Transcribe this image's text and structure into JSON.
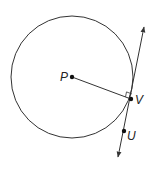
{
  "diagram": {
    "type": "geometry",
    "colors": {
      "stroke": "#333333",
      "background": "#ffffff"
    },
    "circle": {
      "center_label": "P",
      "cx": 72,
      "cy": 77,
      "r": 61
    },
    "points": [
      {
        "label": "P",
        "x": 72,
        "y": 77
      },
      {
        "label": "V",
        "x": 131,
        "y": 99
      },
      {
        "label": "U",
        "x": 124,
        "y": 131
      }
    ],
    "segments": [
      {
        "from": "P",
        "to": "V"
      }
    ],
    "tangent_line": {
      "through": [
        "V",
        "U"
      ],
      "arrows": "both"
    },
    "right_angle_marker": {
      "at": "V",
      "between": [
        "PV",
        "tangent"
      ]
    },
    "labels": {
      "P": "P",
      "V": "V",
      "U": "U"
    }
  }
}
